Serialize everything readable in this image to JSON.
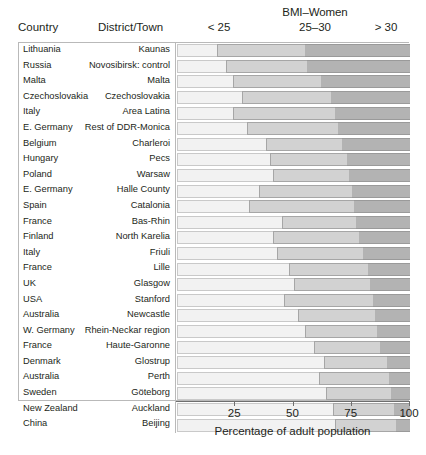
{
  "header": {
    "group_title": "BMI–Women",
    "col_country": "Country",
    "col_district": "District/Town",
    "seg_under25": "< 25",
    "seg_25_30": "25–30",
    "seg_over30": "> 30"
  },
  "axis": {
    "title": "Percentage of adult population",
    "ticks": [
      "25",
      "50",
      "75",
      "100"
    ],
    "tick_values": [
      25,
      50,
      75,
      100
    ],
    "min": 0,
    "max": 100
  },
  "chart_data": {
    "type": "bar",
    "subtype": "stacked-horizontal-floating",
    "title": "BMI–Women",
    "xlabel": "Percentage of adult population",
    "ylabel": "",
    "xlim": [
      0,
      100
    ],
    "grid": false,
    "legend_position": "top",
    "series": [
      {
        "name": "< 25",
        "color": "#f2f2f2"
      },
      {
        "name": "25–30",
        "color": "#d2d2d2"
      },
      {
        "name": "> 30",
        "color": "#b3b3b3"
      }
    ],
    "categories": [
      "Lithuania – Kaunas",
      "Russia – Novosibirsk: control",
      "Malta – Malta",
      "Czechoslovakia – Czechoslovakia",
      "Italy – Area Latina",
      "E. Germany – Rest of DDR-Monica",
      "Belgium – Charleroi",
      "Hungary – Pecs",
      "Poland – Warsaw",
      "E. Germany – Halle County",
      "Spain – Catalonia",
      "France – Bas-Rhin",
      "Finland – North Karelia",
      "Italy – Friuli",
      "France – Lille",
      "UK – Glasgow",
      "USA – Stanford",
      "Australia – Newcastle",
      "W. Germany – Rhein-Neckar region",
      "France – Haute-Garonne",
      "Denmark – Glostrup",
      "Australia – Perth",
      "Sweden – Göteborg",
      "New Zealand – Auckland",
      "China – Beijing"
    ],
    "rows": [
      {
        "country": "Lithuania",
        "district": "Kaunas",
        "under25": 17,
        "mid25_30": 38,
        "over30": 45
      },
      {
        "country": "Russia",
        "district": "Novosibirsk: control",
        "under25": 21,
        "mid25_30": 35,
        "over30": 44
      },
      {
        "country": "Malta",
        "district": "Malta",
        "under25": 24,
        "mid25_30": 38,
        "over30": 38
      },
      {
        "country": "Czechoslovakia",
        "district": "Czechoslovakia",
        "under25": 28,
        "mid25_30": 38,
        "over30": 34
      },
      {
        "country": "Italy",
        "district": "Area Latina",
        "under25": 24,
        "mid25_30": 44,
        "over30": 32
      },
      {
        "country": "E. Germany",
        "district": "Rest of DDR-Monica",
        "under25": 30,
        "mid25_30": 39,
        "over30": 31
      },
      {
        "country": "Belgium",
        "district": "Charleroi",
        "under25": 38,
        "mid25_30": 33,
        "over30": 29
      },
      {
        "country": "Hungary",
        "district": "Pecs",
        "under25": 40,
        "mid25_30": 33,
        "over30": 27
      },
      {
        "country": "Poland",
        "district": "Warsaw",
        "under25": 41,
        "mid25_30": 33,
        "over30": 26
      },
      {
        "country": "E. Germany",
        "district": "Halle County",
        "under25": 35,
        "mid25_30": 40,
        "over30": 25
      },
      {
        "country": "Spain",
        "district": "Catalonia",
        "under25": 31,
        "mid25_30": 45,
        "over30": 24
      },
      {
        "country": "France",
        "district": "Bas-Rhin",
        "under25": 45,
        "mid25_30": 32,
        "over30": 23
      },
      {
        "country": "Finland",
        "district": "North Karelia",
        "under25": 41,
        "mid25_30": 37,
        "over30": 22
      },
      {
        "country": "Italy",
        "district": "Friuli",
        "under25": 43,
        "mid25_30": 37,
        "over30": 20
      },
      {
        "country": "France",
        "district": "Lille",
        "under25": 48,
        "mid25_30": 34,
        "over30": 18
      },
      {
        "country": "UK",
        "district": "Glasgow",
        "under25": 50,
        "mid25_30": 33,
        "over30": 17
      },
      {
        "country": "USA",
        "district": "Stanford",
        "under25": 46,
        "mid25_30": 38,
        "over30": 16
      },
      {
        "country": "Australia",
        "district": "Newcastle",
        "under25": 52,
        "mid25_30": 33,
        "over30": 15
      },
      {
        "country": "W. Germany",
        "district": "Rhein-Neckar region",
        "under25": 55,
        "mid25_30": 31,
        "over30": 14
      },
      {
        "country": "France",
        "district": "Haute-Garonne",
        "under25": 59,
        "mid25_30": 28,
        "over30": 13
      },
      {
        "country": "Denmark",
        "district": "Glostrup",
        "under25": 63,
        "mid25_30": 27,
        "over30": 10
      },
      {
        "country": "Australia",
        "district": "Perth",
        "under25": 61,
        "mid25_30": 30,
        "over30": 9
      },
      {
        "country": "Sweden",
        "district": "Göteborg",
        "under25": 64,
        "mid25_30": 28,
        "over30": 8
      },
      {
        "country": "New Zealand",
        "district": "Auckland",
        "under25": 67,
        "mid25_30": 26,
        "over30": 7
      },
      {
        "country": "China",
        "district": "Beijing",
        "under25": 68,
        "mid25_30": 26,
        "over30": 6
      }
    ]
  }
}
